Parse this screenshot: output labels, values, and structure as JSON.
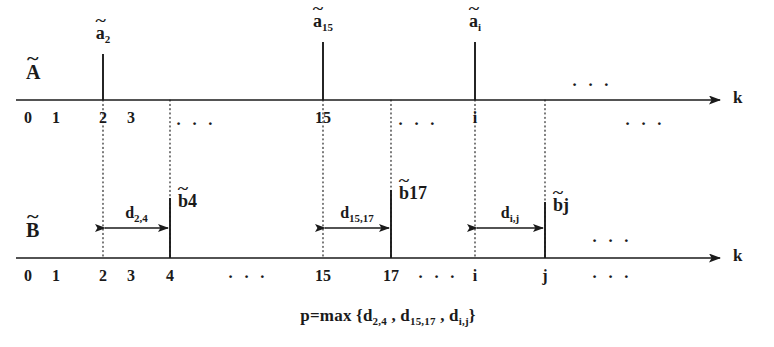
{
  "figure": {
    "width": 774,
    "height": 347,
    "background": "#ffffff",
    "ink": "#1a1a1a"
  },
  "chart_data": {
    "type": "diagram",
    "title": "",
    "axes": [
      {
        "name": "A",
        "name_label": "A",
        "name_accent": "~",
        "variable": "k",
        "y": 100,
        "x_start": 28,
        "x_end": 720,
        "ticks": [
          {
            "label": "0",
            "x": 28
          },
          {
            "label": "1",
            "x": 56
          },
          {
            "label": "2",
            "x": 103
          },
          {
            "label": "3",
            "x": 131
          },
          {
            "label": "15",
            "x": 323
          },
          {
            "label": "i",
            "x": 475
          }
        ],
        "impulses": [
          {
            "label": "a",
            "accent": "~",
            "sub": "2",
            "x": 103,
            "height": 46
          },
          {
            "label": "a",
            "accent": "~",
            "sub": "15",
            "x": 323,
            "height": 58
          },
          {
            "label": "a",
            "accent": "~",
            "sub": "i",
            "x": 475,
            "height": 58
          }
        ],
        "ellipses": [
          {
            "x": 196,
            "y": 115
          },
          {
            "x": 592,
            "y": 76
          },
          {
            "x": 418,
            "y": 115
          },
          {
            "x": 645,
            "y": 115
          }
        ]
      },
      {
        "name": "B",
        "name_label": "B",
        "name_accent": "~",
        "variable": "k",
        "y": 258,
        "x_start": 28,
        "x_end": 720,
        "ticks": [
          {
            "label": "0",
            "x": 28
          },
          {
            "label": "1",
            "x": 56
          },
          {
            "label": "2",
            "x": 103
          },
          {
            "label": "3",
            "x": 131
          },
          {
            "label": "4",
            "x": 170
          },
          {
            "label": "15",
            "x": 323
          },
          {
            "label": "17",
            "x": 391
          },
          {
            "label": "i",
            "x": 475
          },
          {
            "label": "j",
            "x": 545
          }
        ],
        "impulses": [
          {
            "label": "b",
            "accent": "~",
            "sub": "4",
            "x": 170,
            "height": 60
          },
          {
            "label": "b",
            "accent": "~",
            "sub": "17",
            "x": 391,
            "height": 68
          },
          {
            "label": "b",
            "accent": "~",
            "sub": "j",
            "x": 545,
            "height": 56
          }
        ],
        "ellipses": [
          {
            "x": 248,
            "y": 268
          },
          {
            "x": 438,
            "y": 268
          },
          {
            "x": 612,
            "y": 268
          },
          {
            "x": 612,
            "y": 232
          }
        ]
      }
    ],
    "guide_lines": [
      {
        "x": 103,
        "y_top": 100,
        "y_bottom": 258
      },
      {
        "x": 170,
        "y_top": 100,
        "y_bottom": 258
      },
      {
        "x": 323,
        "y_top": 100,
        "y_bottom": 258
      },
      {
        "x": 391,
        "y_top": 100,
        "y_bottom": 258
      },
      {
        "x": 475,
        "y_top": 100,
        "y_bottom": 258
      },
      {
        "x": 545,
        "y_top": 100,
        "y_bottom": 258
      }
    ],
    "distances": [
      {
        "name": "d",
        "sub": "2,4",
        "x_from": 103,
        "x_to": 170,
        "y": 228,
        "label_y": 205
      },
      {
        "name": "d",
        "sub": "15,17",
        "x_from": 323,
        "x_to": 391,
        "y": 228,
        "label_y": 205
      },
      {
        "name": "d",
        "sub": "i,j",
        "x_from": 475,
        "x_to": 545,
        "y": 228,
        "label_y": 205
      }
    ],
    "formula": {
      "lhs": "p=max",
      "open": "{",
      "terms": [
        {
          "name": "d",
          "sub": "2,4"
        },
        {
          "name": "d",
          "sub": "15,17"
        },
        {
          "name": "d",
          "sub": "i,j"
        }
      ],
      "separator": ",",
      "close": "}",
      "x": 388,
      "y": 315
    },
    "ellipsis_glyph": "· · ·"
  }
}
